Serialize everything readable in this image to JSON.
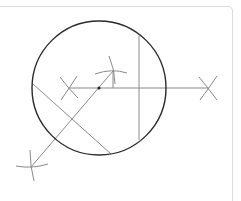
{
  "diagram": {
    "colors": {
      "circle_stroke": "#2a2a2a",
      "construction_stroke": "#8a8a8a",
      "card_border": "#dcdcdc",
      "background": "#ffffff"
    },
    "circle": {
      "cx": 99,
      "cy": 88,
      "r": 67
    },
    "center_point": {
      "x": 99,
      "y": 88
    },
    "lines": [
      {
        "name": "horizontal-ray",
        "x1": 68,
        "y1": 88,
        "x2": 209,
        "y2": 88
      },
      {
        "name": "vertical-chord",
        "x1": 139,
        "y1": 36,
        "x2": 139,
        "y2": 140
      },
      {
        "name": "diagonal-chord",
        "x1": 33,
        "y1": 84,
        "x2": 111,
        "y2": 154
      },
      {
        "name": "diagonal-ray",
        "x1": 31,
        "y1": 167,
        "x2": 113,
        "y2": 71
      },
      {
        "name": "short-perpendicular",
        "x1": 113,
        "y1": 71,
        "x2": 113,
        "y2": 88
      }
    ],
    "arc_marks": [
      {
        "name": "left-x-arc-a",
        "d": "M61,100 Q70,87 77,76"
      },
      {
        "name": "left-x-arc-b",
        "d": "M60,77 Q68,88 78,98"
      },
      {
        "name": "right-x-arc-a",
        "d": "M199,77 Q208,88 217,100"
      },
      {
        "name": "right-x-arc-b",
        "d": "M200,100 Q209,88 217,76"
      },
      {
        "name": "top-arc-horizontal",
        "d": "M95,74 Q112,68 127,73"
      },
      {
        "name": "top-arc-vertical",
        "d": "M109,56 Q115,70 115,84"
      },
      {
        "name": "bottom-arc-horizontal",
        "d": "M16,166 Q32,169 48,164"
      },
      {
        "name": "bottom-arc-vertical",
        "d": "M30,150 Q30,166 34,181"
      }
    ]
  }
}
